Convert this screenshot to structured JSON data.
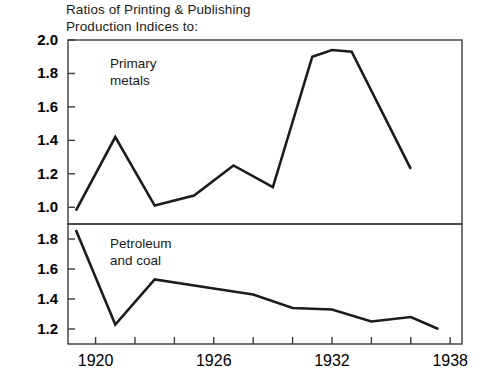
{
  "figure": {
    "title_line1": "Ratios of Printing & Publishing",
    "title_line2": "Production Indices to:"
  },
  "chart_data": {
    "type": "line",
    "title": "Ratios of Printing & Publishing Production Indices to:",
    "xlabel": "",
    "ylabel": "",
    "grid": false,
    "legend": "inline annotations",
    "xlim": [
      1918.6,
      1938.6
    ],
    "xticks": [
      1920,
      1922,
      1924,
      1926,
      1928,
      1930,
      1932,
      1934,
      1936,
      1938
    ],
    "xticklabels": [
      "1920",
      "",
      "",
      "1926",
      "",
      "",
      "1932",
      "",
      "",
      "1938"
    ],
    "panels": [
      {
        "name": "Primary metals",
        "annotation_line1": "Primary",
        "annotation_line2": "metals",
        "ylim": [
          0.9,
          2.0
        ],
        "yticks": [
          1.0,
          1.2,
          1.4,
          1.6,
          1.8,
          2.0
        ],
        "yticklabels": [
          "1.0",
          "1.2",
          "1.4",
          "1.6",
          "1.8",
          "2.0"
        ],
        "series": [
          {
            "name": "Printing & Publishing / Primary metals",
            "x": [
              1919,
              1921,
              1923,
              1925,
              1927,
              1929,
              1931,
              1932,
              1933,
              1936
            ],
            "values": [
              0.98,
              1.42,
              1.01,
              1.07,
              1.25,
              1.12,
              1.9,
              1.94,
              1.93,
              1.23
            ]
          }
        ]
      },
      {
        "name": "Petroleum and coal",
        "annotation_line1": "Petroleum",
        "annotation_line2": "and coal",
        "ylim": [
          1.1,
          1.9
        ],
        "yticks": [
          1.2,
          1.4,
          1.6,
          1.8
        ],
        "yticklabels": [
          "1.2",
          "1.4",
          "1.6",
          "1.8"
        ],
        "series": [
          {
            "name": "Printing & Publishing / Petroleum and coal",
            "x": [
              1919,
              1921,
              1923,
              1926,
              1928,
              1930,
              1932,
              1934,
              1936,
              1937.4
            ],
            "values": [
              1.86,
              1.23,
              1.53,
              1.47,
              1.43,
              1.34,
              1.33,
              1.25,
              1.28,
              1.2
            ]
          }
        ]
      }
    ]
  },
  "colors": {
    "line": "#1c1c1c",
    "frame": "#3a3a3a",
    "background": "#ffffff"
  }
}
